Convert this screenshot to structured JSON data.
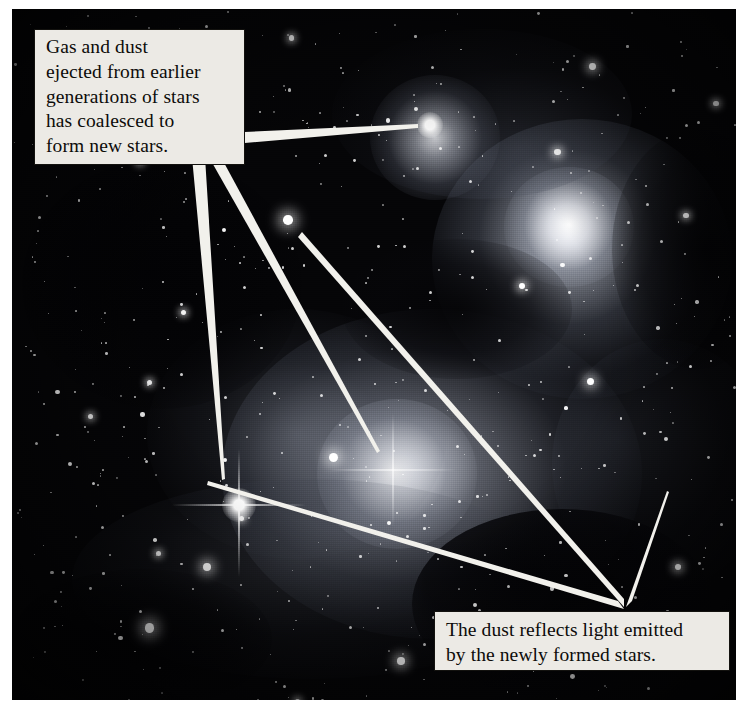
{
  "figure": {
    "type": "annotated-astronomical-photograph",
    "background_color": "#050507",
    "caption_box_color": "#eceae5",
    "caption_border_color": "#13120f",
    "leader_line_color": "#f2f1ec"
  },
  "captions": [
    {
      "id": "gas-and-dust",
      "text": "Gas and dust ejected from earlier generations of stars has coalesced to form new stars.",
      "lines": [
        "Gas and dust",
        "ejected from earlier",
        "generations of stars",
        "has coalesced to",
        "form new stars."
      ]
    },
    {
      "id": "dust-reflects",
      "text": "The dust reflects light emitted by the newly formed stars.",
      "lines": [
        "The dust reflects light emitted",
        "by the newly formed stars."
      ]
    }
  ],
  "leader_lines": [
    {
      "from_caption": "gas-and-dust",
      "points_to": "bright-star-upper-right"
    },
    {
      "from_caption": "gas-and-dust",
      "points_to": "bright-star-lower-left"
    },
    {
      "from_caption": "gas-and-dust",
      "points_to": "nebula-core-center"
    },
    {
      "from_caption": "dust-reflects",
      "points_to": "reflection-nebula-center"
    },
    {
      "from_caption": "dust-reflects",
      "points_to": "reflection-nebula-upper"
    },
    {
      "from_caption": "dust-reflects",
      "points_to": "dust-lane-right"
    }
  ],
  "features": [
    {
      "name": "bright-star-upper-right",
      "x": 417,
      "y": 124
    },
    {
      "name": "bright-star-lower-left",
      "x": 234,
      "y": 503
    },
    {
      "name": "nebula-core-center",
      "x": 380,
      "y": 462
    },
    {
      "name": "reflection-nebula-upper-right",
      "x": 548,
      "y": 224
    },
    {
      "name": "dark-dust-lane",
      "x": 480,
      "y": 560
    }
  ]
}
